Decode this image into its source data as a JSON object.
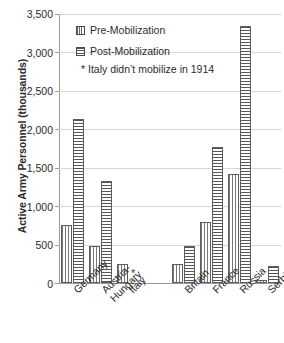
{
  "chart_data": {
    "type": "bar",
    "title": "",
    "xlabel": "",
    "ylabel": "Active Army Personnel (thousands)",
    "ylim": [
      0,
      3500
    ],
    "ytick_values": [
      0,
      500,
      1000,
      1500,
      2000,
      2500,
      3000,
      3500
    ],
    "ytick_labels": [
      "0",
      "500",
      "1,000",
      "1,500",
      "2,000",
      "2,500",
      "3,000",
      "3,500"
    ],
    "grid": true,
    "legend_position": "upper-left-inside",
    "categories": [
      "Germany",
      "Austria-Hungary",
      "Italy",
      "",
      "Britain",
      "France",
      "Russia",
      "Serbia"
    ],
    "category_label_lines": [
      [
        "Germany"
      ],
      [
        "Austria-",
        "Hungary"
      ],
      [
        "Italy"
      ],
      [
        ""
      ],
      [
        "Britain"
      ],
      [
        "France"
      ],
      [
        "Russia"
      ],
      [
        "Serbia"
      ]
    ],
    "series": [
      {
        "name": "Pre-Mobilization",
        "pattern": "vertical-stripes",
        "values": [
          760,
          480,
          250,
          null,
          250,
          800,
          1420,
          45
        ]
      },
      {
        "name": "Post-Mobilization",
        "pattern": "horizontal-stripes",
        "values": [
          2130,
          1330,
          null,
          null,
          480,
          1770,
          3350,
          220
        ]
      }
    ],
    "annotations": [
      {
        "text": "*",
        "category": "Italy",
        "series": "Post-Mobilization",
        "meaning": "Italy didn't mobilize in 1914"
      }
    ]
  },
  "legend": {
    "items": [
      {
        "label": "Pre-Mobilization",
        "swatch": "vertical-stripes-swatch"
      },
      {
        "label": "Post-Mobilization",
        "swatch": "horizontal-stripes-swatch"
      }
    ],
    "note": "* Italy didn’t mobilize in 1914"
  },
  "axes": {
    "y_title": "Active Army Personnel (thousands)"
  }
}
